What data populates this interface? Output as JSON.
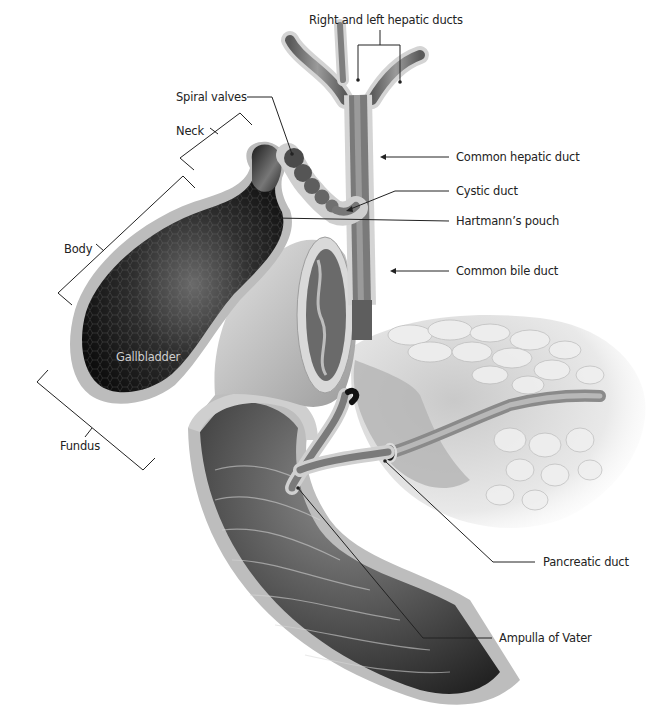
{
  "diagram": {
    "labels": {
      "hepatic_ducts": "Right and left hepatic ducts",
      "spiral_valves": "Spiral valves",
      "neck": "Neck",
      "common_hepatic_duct": "Common hepatic duct",
      "cystic_duct": "Cystic duct",
      "hartmanns_pouch": "Hartmann’s pouch",
      "body": "Body",
      "common_bile_duct": "Common bile duct",
      "gallbladder": "Gallbladder",
      "fundus": "Fundus",
      "pancreatic_duct": "Pancreatic duct",
      "ampulla": "Ampulla of Vater"
    },
    "colors": {
      "background": "#ffffff",
      "leader_line": "#222222",
      "label_text": "#222222",
      "gallbladder_lumen": "#1a1a1a",
      "wall": "#bdbdbd",
      "duct": "#7a7a7a",
      "pancreas": "#e6e6e6"
    }
  }
}
